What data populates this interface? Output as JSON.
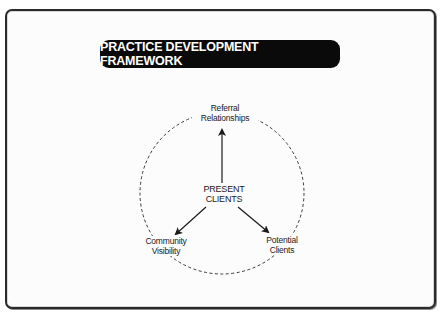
{
  "title": "PRACTICE DEVELOPMENT FRAMEWORK",
  "diagram": {
    "center": {
      "line1": "PRESENT",
      "line2": "CLIENTS"
    },
    "nodes": [
      {
        "position": "top",
        "line1": "Referral",
        "line2": "Relationships"
      },
      {
        "position": "bottom-left",
        "line1": "Community",
        "line2": "Visibility"
      },
      {
        "position": "bottom-right",
        "line1": "Potential",
        "line2": "Clients"
      }
    ],
    "edges": [
      {
        "from": "PRESENT CLIENTS",
        "to": "Referral Relationships"
      },
      {
        "from": "PRESENT CLIENTS",
        "to": "Community Visibility"
      },
      {
        "from": "PRESENT CLIENTS",
        "to": "Potential Clients"
      }
    ],
    "ring_style": "dashed"
  },
  "colors": {
    "banner_bg": "#0a0a0a",
    "banner_text": "#ffffff",
    "line": "#1a1a1a",
    "background": "#fcfcfc"
  }
}
